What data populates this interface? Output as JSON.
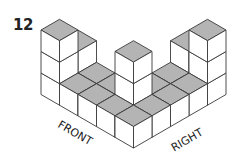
{
  "problem_number": "12",
  "labels": {
    "front": "FRONT",
    "right": "RIGHT"
  },
  "figure": {
    "colors": {
      "top_face": "#b4b4b4",
      "side_face": "#ffffff",
      "edge": "#3a3a3a"
    },
    "iso": {
      "origin": [
        41,
        94.5
      ],
      "dx": 18.5,
      "dy": 10.7,
      "dz": 21.5
    },
    "heightmap": [
      {
        "x": 0,
        "y": 0,
        "h": 3
      },
      {
        "x": 0,
        "y": 1,
        "h": 2
      },
      {
        "x": 1,
        "y": 0,
        "h": 1
      },
      {
        "x": 1,
        "y": 1,
        "h": 1
      },
      {
        "x": 2,
        "y": 0,
        "h": 1
      },
      {
        "x": 2,
        "y": 1,
        "h": 1
      },
      {
        "x": 3,
        "y": 0,
        "h": 1
      },
      {
        "x": 3,
        "y": 1,
        "h": 3
      },
      {
        "x": 4,
        "y": 0,
        "h": 1
      },
      {
        "x": 4,
        "y": 1,
        "h": 1
      },
      {
        "x": 3,
        "y": 2,
        "h": 1
      },
      {
        "x": 4,
        "y": 2,
        "h": 1
      },
      {
        "x": 3,
        "y": 3,
        "h": 1
      },
      {
        "x": 4,
        "y": 3,
        "h": 1
      },
      {
        "x": 3,
        "y": 4,
        "h": 2
      },
      {
        "x": 4,
        "y": 4,
        "h": 3
      }
    ]
  }
}
